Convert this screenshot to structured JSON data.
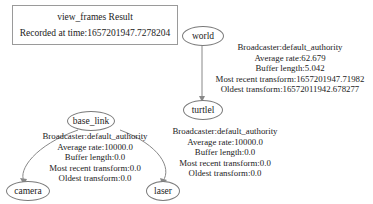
{
  "legend": {
    "title": "view_frames Result",
    "recorded": "Recorded at time:1657201947.7278204"
  },
  "nodes": {
    "world": "world",
    "turtle": "turtlel",
    "base_link": "base_link",
    "camera": "camera",
    "laser": "laser"
  },
  "edges": {
    "world_turtle": {
      "broadcaster": "Broadcaster:default_authority",
      "rate": "Average rate:62.679",
      "buffer": "Buffer length:5.042",
      "recent": "Most recent transform:1657201947.71982",
      "oldest": "Oldest transform:16572011942.678277"
    },
    "base_link_children": {
      "broadcaster": "Broadcaster:default_authority",
      "rate": "Average rate:10000.0",
      "buffer": "Buffer length:0.0",
      "recent": "Most recent transform:0.0",
      "oldest": "Oldest transform:0.0"
    },
    "turtle_info": {
      "broadcaster": "Broadcaster:default_authority",
      "rate": "Average rate:10000.0",
      "buffer": "Buffer length:0.0",
      "recent": "Most recent transform:0.0",
      "oldest": "Oldest transform:0.0"
    }
  }
}
